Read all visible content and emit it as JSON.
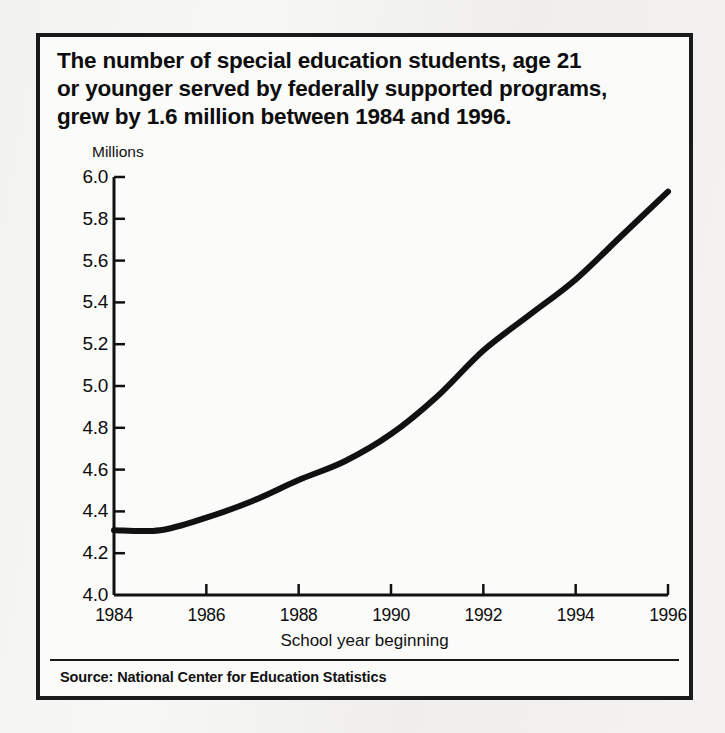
{
  "figure": {
    "title_lines": [
      "The number of special education students, age 21",
      "or younger served by federally supported programs,",
      "grew by 1.6 million between 1984 and 1996."
    ],
    "source": "Source: National Center for Education Statistics"
  },
  "chart_data": {
    "type": "line",
    "title": "The number of special education students, age 21 or younger served by federally supported programs, grew by 1.6 million between 1984 and 1996.",
    "xlabel": "School year beginning",
    "ylabel": "Millions",
    "ylim": [
      4.0,
      6.0
    ],
    "xlim": [
      1984,
      1996
    ],
    "grid": false,
    "legend": "none",
    "ytick_labels": [
      "6.0",
      "5.8",
      "5.6",
      "5.4",
      "5.2",
      "5.0",
      "4.8",
      "4.6",
      "4.4",
      "4.2",
      "4.0"
    ],
    "ytick_values": [
      6.0,
      5.8,
      5.6,
      5.4,
      5.2,
      5.0,
      4.8,
      4.6,
      4.4,
      4.2,
      4.0
    ],
    "xtick_labels": [
      "1984",
      "1986",
      "1988",
      "1990",
      "1992",
      "1994",
      "1996"
    ],
    "xtick_values": [
      1984,
      1986,
      1988,
      1990,
      1992,
      1994,
      1996
    ],
    "line_color": "#111111",
    "x": [
      1984,
      1985,
      1986,
      1987,
      1988,
      1989,
      1990,
      1991,
      1992,
      1993,
      1994,
      1995,
      1996
    ],
    "values": [
      4.31,
      4.31,
      4.37,
      4.45,
      4.55,
      4.64,
      4.77,
      4.95,
      5.17,
      5.34,
      5.51,
      5.72,
      5.93
    ]
  }
}
